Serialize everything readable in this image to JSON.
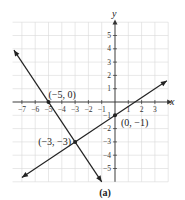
{
  "chart_data": {
    "type": "line",
    "title": "",
    "caption": "(a)",
    "xlabel": "x",
    "ylabel": "y",
    "xlim": [
      -8,
      4
    ],
    "ylim": [
      -6,
      6
    ],
    "grid": true,
    "x_ticks": [
      -7,
      -6,
      -5,
      -4,
      -3,
      -2,
      -1,
      1,
      2,
      3
    ],
    "y_ticks": [
      5,
      4,
      3,
      2,
      1,
      -1,
      -2,
      -3,
      -4,
      -5
    ],
    "series": [
      {
        "name": "line1",
        "slope": -1.5,
        "intercept": -7.5,
        "x": [
          -7.6,
          -1.0
        ],
        "y": [
          3.9,
          -6.0
        ]
      },
      {
        "name": "line2",
        "slope": 0.6667,
        "intercept": -1,
        "x": [
          -7.0,
          3.9
        ],
        "y": [
          -5.67,
          1.6
        ]
      }
    ],
    "points": [
      {
        "label": "(−5, 0)",
        "x": -5,
        "y": 0
      },
      {
        "label": "(−3, −3)",
        "x": -3,
        "y": -3
      },
      {
        "label": "(0, −1)",
        "x": 0,
        "y": -1
      }
    ]
  }
}
